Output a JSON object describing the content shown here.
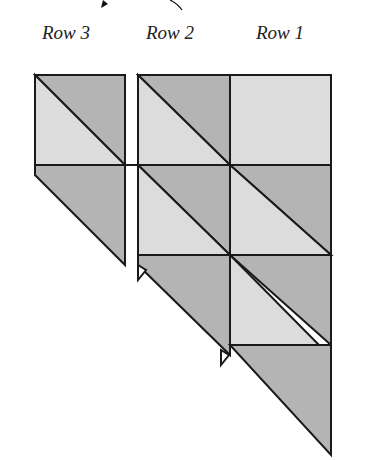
{
  "labels": {
    "row3": "Row 3",
    "row2": "Row 2",
    "row1": "Row 1"
  },
  "colors": {
    "light": "#dcdcdc",
    "dark": "#b4b4b4",
    "stroke": "#1a1a1a"
  },
  "columns": [
    {
      "name": "Row 3",
      "blocks": [
        "half-square-triangle",
        "triangle"
      ]
    },
    {
      "name": "Row 2",
      "blocks": [
        "half-square-triangle",
        "half-square-triangle",
        "triangle"
      ]
    },
    {
      "name": "Row 1",
      "blocks": [
        "light-square",
        "half-square-triangle",
        "half-square-triangle",
        "triangle"
      ]
    }
  ]
}
